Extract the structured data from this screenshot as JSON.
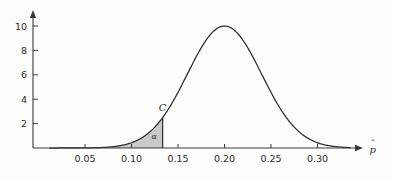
{
  "figure": {
    "background_color": "#fdfdfc",
    "axis_color": "#3a3a3a",
    "curve_color": "#2b2b2b",
    "shade_color": "#c9c9c9",
    "shade_stroke_color": "#8f8f8f"
  },
  "axes": {
    "x_axis_title": "p̂",
    "x_axis_title_base": "p",
    "x_axis_title_hat": "ˆ",
    "y_axis_title": "",
    "x_ticks": [
      "0.05",
      "0.10",
      "0.15",
      "0.20",
      "0.25",
      "0.30"
    ],
    "x_tick_values": [
      0.05,
      0.1,
      0.15,
      0.2,
      0.25,
      0.3
    ],
    "y_ticks": [
      "2",
      "4",
      "6",
      "8",
      "10"
    ],
    "y_tick_values": [
      2,
      4,
      6,
      8,
      10
    ]
  },
  "annotations": {
    "critical_value_label": "C",
    "alpha_label": "α"
  },
  "chart_data": {
    "type": "area",
    "title": "",
    "subtitle": "",
    "xlabel": "p̂",
    "ylabel": "",
    "xlim": [
      0.012,
      0.335
    ],
    "ylim": [
      0,
      11.0
    ],
    "grid": false,
    "legend": null,
    "curve": {
      "name": "Sampling distribution of p-hat (normal density)",
      "distribution": "normal",
      "mean": 0.2,
      "std_dev": 0.0399,
      "peak_x": 0.2,
      "peak_y": 10.0,
      "x": [
        0.012,
        0.03,
        0.05,
        0.06,
        0.07,
        0.08,
        0.09,
        0.1,
        0.11,
        0.12,
        0.1335,
        0.14,
        0.15,
        0.16,
        0.17,
        0.18,
        0.19,
        0.2,
        0.21,
        0.22,
        0.23,
        0.24,
        0.25,
        0.26,
        0.27,
        0.28,
        0.29,
        0.3,
        0.31,
        0.32,
        0.33
      ],
      "y": [
        0.0,
        0.01,
        0.05,
        0.11,
        0.22,
        0.42,
        0.76,
        1.3,
        2.09,
        3.19,
        4.6,
        4.58,
        6.15,
        7.68,
        8.92,
        9.71,
        9.99,
        10.0,
        9.71,
        8.92,
        7.68,
        6.15,
        4.58,
        3.19,
        2.09,
        1.3,
        0.76,
        0.42,
        0.22,
        0.11,
        0.05
      ]
    },
    "shaded_region": {
      "label": "α",
      "description": "left tail rejection region below critical value C",
      "x_from": 0.012,
      "x_to": 0.1335,
      "boundary_label": "C",
      "boundary_x": 0.1335,
      "boundary_y": 2.55,
      "fill_color": "#c9c9c9"
    },
    "annotations": [
      {
        "text": "C",
        "x": 0.1335,
        "y": 3.05,
        "style": "italic"
      },
      {
        "text": "α",
        "x": 0.1245,
        "y": 0.75,
        "style": "italic"
      }
    ]
  }
}
